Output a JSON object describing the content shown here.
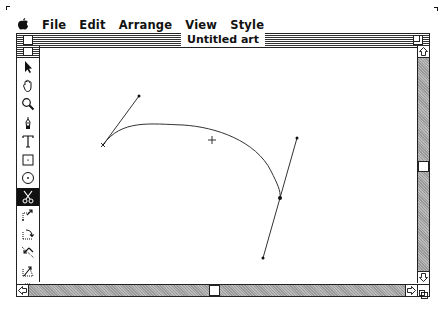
{
  "menubar": {
    "apple_icon": "apple-icon",
    "items": [
      "File",
      "Edit",
      "Arrange",
      "View",
      "Style"
    ]
  },
  "window": {
    "title": "Untitled art"
  },
  "toolbox": {
    "tools": [
      {
        "name": "arrow-tool",
        "icon": "arrow-icon"
      },
      {
        "name": "grabber-tool",
        "icon": "hand-icon"
      },
      {
        "name": "magnifier-tool",
        "icon": "magnifier-icon"
      },
      {
        "name": "pen-tool",
        "icon": "pen-nib-icon"
      },
      {
        "name": "text-tool",
        "icon": "text-t-icon"
      },
      {
        "name": "rectangle-tool",
        "icon": "centered-rectangle-icon"
      },
      {
        "name": "oval-tool",
        "icon": "centered-oval-icon"
      },
      {
        "name": "scissors-tool",
        "icon": "scissors-icon",
        "active": true
      },
      {
        "name": "scale-tool",
        "icon": "scale-icon"
      },
      {
        "name": "rotate-tool",
        "icon": "rotate-icon"
      },
      {
        "name": "reflect-tool",
        "icon": "reflect-icon"
      },
      {
        "name": "shear-tool",
        "icon": "shear-icon"
      },
      {
        "name": "page-tool",
        "icon": "page-icon"
      }
    ]
  },
  "canvas": {
    "path": {
      "anchor_start": [
        79,
        111
      ],
      "control_start": [
        115,
        62
      ],
      "anchor_end": [
        256,
        163
      ],
      "control_end_a": [
        273,
        103
      ],
      "control_end_b": [
        239,
        223
      ],
      "crosshair": [
        188,
        104
      ]
    }
  },
  "scrollbars": {
    "vertical_thumb_position": "middle",
    "horizontal_thumb_position": "middle"
  }
}
